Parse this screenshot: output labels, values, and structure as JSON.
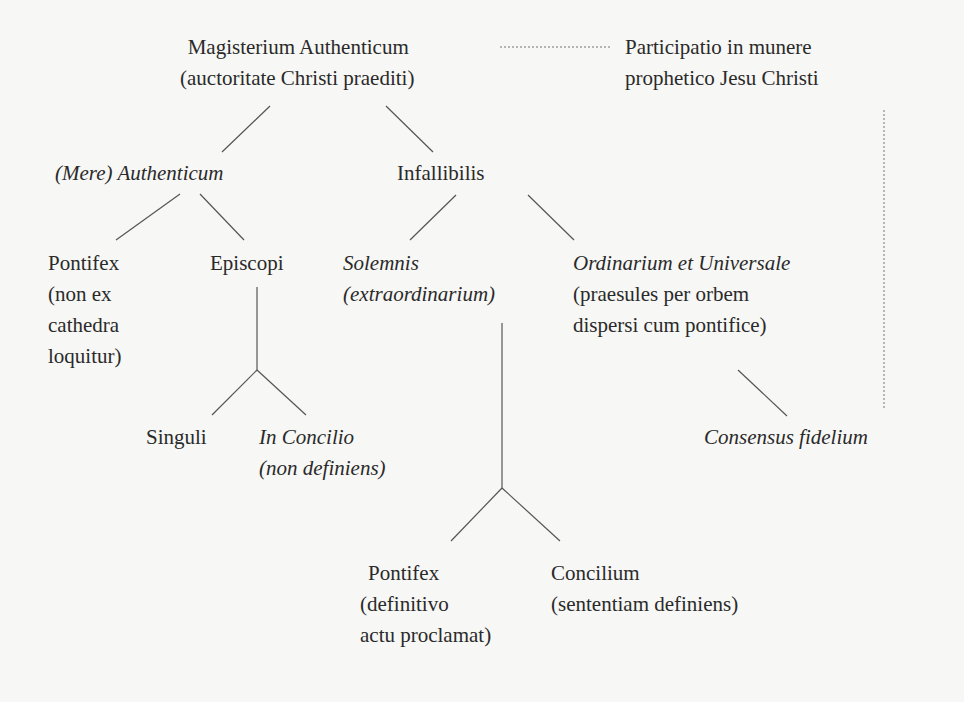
{
  "diagram": {
    "type": "hierarchy-tree",
    "nodes": {
      "root": {
        "title": "Magisterium Authenticum",
        "subtitle": "(auctoritate Christi praediti)"
      },
      "participation": {
        "line1": "Participatio in munere",
        "line2": "prophetico Jesu Christi"
      },
      "mere_authenticum": {
        "title": "(Mere) Authenticum"
      },
      "infallibilis": {
        "title": "Infallibilis"
      },
      "pontifex_non_ex": {
        "line1": "Pontifex",
        "line2": "(non ex",
        "line3": "cathedra",
        "line4": "loquitur)"
      },
      "episcopi": {
        "title": "Episcopi"
      },
      "solemnis": {
        "title": "Solemnis",
        "subtitle": "(extraordinarium)"
      },
      "ordinarium": {
        "title": "Ordinarium et Universale",
        "line2": "(praesules per orbem",
        "line3": "dispersi cum pontifice)"
      },
      "singuli": {
        "title": "Singuli"
      },
      "in_concilio": {
        "title": "In Concilio",
        "subtitle": "(non definiens)"
      },
      "consensus": {
        "title": "Consensus fidelium"
      },
      "pontifex_definitivo": {
        "line1": "Pontifex",
        "line2": "(definitivo",
        "line3": "actu proclamat)"
      },
      "concilium": {
        "title": "Concilium",
        "subtitle": "(sententiam definiens)"
      }
    },
    "edges": [
      {
        "from": "root",
        "to": "mere_authenticum",
        "style": "solid"
      },
      {
        "from": "root",
        "to": "infallibilis",
        "style": "solid"
      },
      {
        "from": "root",
        "to": "participation",
        "style": "dotted"
      },
      {
        "from": "mere_authenticum",
        "to": "pontifex_non_ex",
        "style": "solid"
      },
      {
        "from": "mere_authenticum",
        "to": "episcopi",
        "style": "solid"
      },
      {
        "from": "episcopi",
        "to": "singuli",
        "style": "solid"
      },
      {
        "from": "episcopi",
        "to": "in_concilio",
        "style": "solid"
      },
      {
        "from": "infallibilis",
        "to": "solemnis",
        "style": "solid"
      },
      {
        "from": "infallibilis",
        "to": "ordinarium",
        "style": "solid"
      },
      {
        "from": "solemnis",
        "to": "pontifex_definitivo",
        "style": "solid"
      },
      {
        "from": "solemnis",
        "to": "concilium",
        "style": "solid"
      },
      {
        "from": "ordinarium",
        "to": "consensus",
        "style": "solid"
      },
      {
        "from": "participation",
        "to": "consensus",
        "style": "dotted"
      }
    ],
    "colors": {
      "text": "#2a2a2a",
      "line": "#555555",
      "background": "#f7f7f5"
    }
  }
}
